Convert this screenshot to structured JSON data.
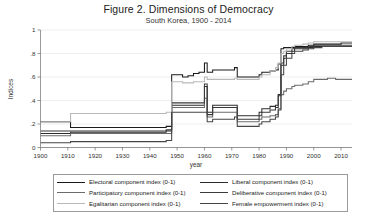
{
  "figure": {
    "title": "Figure 2. Dimensions of Democracy",
    "subtitle": "South Korea, 1900 - 2014"
  },
  "legend": {
    "items": [
      {
        "label": "Electoral component index (0-1)",
        "color": "#1b1b1b",
        "width": 1.6
      },
      {
        "label": "Liberal component index (0-1)",
        "color": "#2c2c2c",
        "width": 1.3
      },
      {
        "label": "Participatory component index (0-1)",
        "color": "#6b6b6b",
        "width": 1.3
      },
      {
        "label": "Deliberative component index (0-1)",
        "color": "#3a3a3a",
        "width": 1.3
      },
      {
        "label": "Egalitarian component index (0-1)",
        "color": "#b9b9b9",
        "width": 1.3
      },
      {
        "label": "Female empowerment index (0-1)",
        "color": "#454545",
        "width": 1.3
      }
    ]
  },
  "chart_data": {
    "type": "line",
    "title": "Figure 2. Dimensions of Democracy",
    "subtitle": "South Korea, 1900 - 2014",
    "xlabel": "year",
    "ylabel": "Indices",
    "xlim": [
      1900,
      2014
    ],
    "ylim": [
      0,
      1
    ],
    "xticks": [
      1900,
      1910,
      1920,
      1930,
      1940,
      1950,
      1960,
      1970,
      1980,
      1990,
      2000,
      2010
    ],
    "yticks": [
      0,
      0.2,
      0.4,
      0.6,
      0.8,
      1
    ],
    "ytick_labels": [
      "0",
      ".2",
      ".4",
      ".6",
      ".8",
      "1"
    ],
    "grid": "horizontal",
    "legend_position": "bottom",
    "x": [
      1900,
      1905,
      1910,
      1911,
      1918,
      1919,
      1930,
      1940,
      1944,
      1945,
      1946,
      1948,
      1949,
      1950,
      1952,
      1954,
      1956,
      1958,
      1960,
      1961,
      1962,
      1963,
      1964,
      1968,
      1971,
      1972,
      1973,
      1979,
      1980,
      1981,
      1984,
      1986,
      1987,
      1988,
      1989,
      1990,
      1992,
      1993,
      1996,
      1998,
      2000,
      2003,
      2005,
      2008,
      2010,
      2012,
      2014
    ],
    "series": [
      {
        "name": "Electoral component index (0-1)",
        "color": "#1b1b1b",
        "values": [
          0.22,
          0.22,
          0.22,
          0.17,
          0.17,
          0.17,
          0.17,
          0.17,
          0.17,
          0.17,
          0.18,
          0.62,
          0.62,
          0.62,
          0.6,
          0.61,
          0.63,
          0.64,
          0.72,
          0.64,
          0.64,
          0.66,
          0.66,
          0.66,
          0.68,
          0.6,
          0.6,
          0.6,
          0.62,
          0.64,
          0.65,
          0.66,
          0.71,
          0.84,
          0.85,
          0.85,
          0.85,
          0.86,
          0.86,
          0.87,
          0.88,
          0.88,
          0.88,
          0.88,
          0.89,
          0.89,
          0.89
        ]
      },
      {
        "name": "Liberal component index (0-1)",
        "color": "#2c2c2c",
        "values": [
          0.12,
          0.12,
          0.12,
          0.13,
          0.13,
          0.13,
          0.13,
          0.13,
          0.13,
          0.13,
          0.14,
          0.36,
          0.36,
          0.36,
          0.36,
          0.36,
          0.36,
          0.36,
          0.52,
          0.3,
          0.3,
          0.36,
          0.36,
          0.36,
          0.36,
          0.27,
          0.27,
          0.27,
          0.3,
          0.33,
          0.35,
          0.36,
          0.45,
          0.7,
          0.76,
          0.8,
          0.82,
          0.84,
          0.84,
          0.85,
          0.86,
          0.86,
          0.86,
          0.86,
          0.86,
          0.86,
          0.86
        ]
      },
      {
        "name": "Participatory component index (0-1)",
        "color": "#6b6b6b",
        "values": [
          0.1,
          0.1,
          0.1,
          0.12,
          0.12,
          0.12,
          0.12,
          0.12,
          0.12,
          0.12,
          0.12,
          0.34,
          0.34,
          0.34,
          0.34,
          0.34,
          0.34,
          0.34,
          0.42,
          0.26,
          0.26,
          0.3,
          0.3,
          0.3,
          0.3,
          0.22,
          0.22,
          0.22,
          0.24,
          0.26,
          0.27,
          0.28,
          0.33,
          0.45,
          0.48,
          0.5,
          0.52,
          0.53,
          0.54,
          0.56,
          0.58,
          0.58,
          0.59,
          0.58,
          0.58,
          0.58,
          0.58
        ]
      },
      {
        "name": "Deliberative component index (0-1)",
        "color": "#3a3a3a",
        "values": [
          0.14,
          0.14,
          0.14,
          0.14,
          0.14,
          0.14,
          0.14,
          0.14,
          0.14,
          0.14,
          0.15,
          0.38,
          0.38,
          0.38,
          0.38,
          0.38,
          0.38,
          0.38,
          0.54,
          0.28,
          0.28,
          0.34,
          0.34,
          0.34,
          0.34,
          0.24,
          0.24,
          0.24,
          0.27,
          0.3,
          0.32,
          0.34,
          0.44,
          0.72,
          0.78,
          0.82,
          0.84,
          0.85,
          0.85,
          0.86,
          0.87,
          0.87,
          0.87,
          0.87,
          0.87,
          0.87,
          0.87
        ]
      },
      {
        "name": "Egalitarian component index (0-1)",
        "color": "#b9b9b9",
        "values": [
          0.22,
          0.22,
          0.22,
          0.29,
          0.29,
          0.29,
          0.29,
          0.29,
          0.29,
          0.29,
          0.3,
          0.56,
          0.56,
          0.56,
          0.55,
          0.55,
          0.56,
          0.56,
          0.6,
          0.58,
          0.58,
          0.58,
          0.58,
          0.58,
          0.59,
          0.58,
          0.58,
          0.58,
          0.6,
          0.62,
          0.65,
          0.68,
          0.72,
          0.8,
          0.82,
          0.84,
          0.86,
          0.87,
          0.88,
          0.89,
          0.9,
          0.9,
          0.9,
          0.9,
          0.9,
          0.9,
          0.9
        ]
      },
      {
        "name": "Female empowerment index (0-1)",
        "color": "#454545",
        "values": [
          0.04,
          0.04,
          0.04,
          0.05,
          0.05,
          0.05,
          0.05,
          0.05,
          0.05,
          0.05,
          0.06,
          0.3,
          0.3,
          0.3,
          0.3,
          0.3,
          0.3,
          0.3,
          0.3,
          0.22,
          0.22,
          0.24,
          0.24,
          0.24,
          0.26,
          0.18,
          0.18,
          0.18,
          0.2,
          0.22,
          0.24,
          0.26,
          0.32,
          0.62,
          0.7,
          0.76,
          0.8,
          0.82,
          0.83,
          0.84,
          0.85,
          0.86,
          0.86,
          0.86,
          0.86,
          0.86,
          0.86
        ]
      }
    ]
  }
}
